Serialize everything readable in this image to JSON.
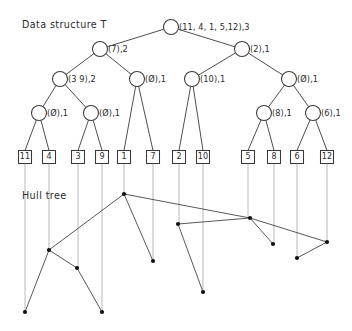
{
  "figure": {
    "width": 352,
    "height": 331,
    "background": "#ffffff",
    "stroke_color": "#3a3a3a",
    "leaf_stem_color": "#b9b9b9",
    "hull_vertex_color": "#111111",
    "captions": {
      "data_structure": "Data structure T",
      "hull_tree": "Hull tree"
    }
  },
  "tree": {
    "nodes": [
      {
        "id": "n0",
        "level": 0,
        "cx": 171,
        "cy": 27,
        "r": 7.5,
        "label": "(11, 4, 1, 5,12),3"
      },
      {
        "id": "n1",
        "level": 1,
        "cx": 100,
        "cy": 49,
        "r": 7.5,
        "label": "(7),2"
      },
      {
        "id": "n2",
        "level": 1,
        "cx": 242,
        "cy": 49,
        "r": 7.5,
        "label": "(2),1"
      },
      {
        "id": "n3",
        "level": 2,
        "cx": 60,
        "cy": 79,
        "r": 7.5,
        "label": "(3 9),2"
      },
      {
        "id": "n4",
        "level": 2,
        "cx": 137,
        "cy": 79,
        "r": 7.5,
        "label": "(Ø),1"
      },
      {
        "id": "n5",
        "level": 2,
        "cx": 192,
        "cy": 79,
        "r": 7.5,
        "label": "(10),1"
      },
      {
        "id": "n6",
        "level": 2,
        "cx": 289,
        "cy": 79,
        "r": 7.5,
        "label": "(Ø),1"
      },
      {
        "id": "n7",
        "level": 3,
        "cx": 39,
        "cy": 113,
        "r": 7.5,
        "label": "(Ø),1"
      },
      {
        "id": "n8",
        "level": 3,
        "cx": 91,
        "cy": 113,
        "r": 7.5,
        "label": "(Ø),1"
      },
      {
        "id": "n9",
        "level": 3,
        "cx": 264,
        "cy": 113,
        "r": 7.5,
        "label": "(8),1"
      },
      {
        "id": "n10",
        "level": 3,
        "cx": 313,
        "cy": 113,
        "r": 7.5,
        "label": "(6),1"
      }
    ],
    "edges": [
      [
        "n0",
        "n1"
      ],
      [
        "n0",
        "n2"
      ],
      [
        "n1",
        "n3"
      ],
      [
        "n1",
        "n4"
      ],
      [
        "n2",
        "n5"
      ],
      [
        "n2",
        "n6"
      ],
      [
        "n3",
        "n7"
      ],
      [
        "n3",
        "n8"
      ],
      [
        "n6",
        "n9"
      ],
      [
        "n6",
        "n10"
      ]
    ],
    "leaf_edges": [
      [
        "n7",
        "L11"
      ],
      [
        "n7",
        "L4"
      ],
      [
        "n8",
        "L3"
      ],
      [
        "n8",
        "L9"
      ],
      [
        "n4",
        "L1"
      ],
      [
        "n4",
        "L7"
      ],
      [
        "n5",
        "L2"
      ],
      [
        "n5",
        "L10"
      ],
      [
        "n9",
        "L5"
      ],
      [
        "n9",
        "L8"
      ],
      [
        "n10",
        "L6"
      ],
      [
        "n10",
        "L12"
      ]
    ],
    "leaves": [
      {
        "id": "L11",
        "cx": 25,
        "cy": 157,
        "label": "11"
      },
      {
        "id": "L4",
        "cx": 49,
        "cy": 157,
        "label": "4"
      },
      {
        "id": "L3",
        "cx": 78,
        "cy": 157,
        "label": "3"
      },
      {
        "id": "L9",
        "cx": 102,
        "cy": 157,
        "label": "9"
      },
      {
        "id": "L1",
        "cx": 124,
        "cy": 157,
        "label": "1"
      },
      {
        "id": "L7",
        "cx": 153,
        "cy": 157,
        "label": "7"
      },
      {
        "id": "L2",
        "cx": 179,
        "cy": 157,
        "label": "2"
      },
      {
        "id": "L10",
        "cx": 203,
        "cy": 157,
        "label": "10"
      },
      {
        "id": "L5",
        "cx": 248,
        "cy": 157,
        "label": "5"
      },
      {
        "id": "L8",
        "cx": 274,
        "cy": 157,
        "label": "8"
      },
      {
        "id": "L6",
        "cx": 297,
        "cy": 157,
        "label": "6"
      },
      {
        "id": "L12",
        "cx": 327,
        "cy": 157,
        "label": "12"
      }
    ],
    "leaf_box": {
      "w": 13,
      "h": 13
    }
  },
  "hull_tree": {
    "stems": [
      {
        "from_leaf": "L11",
        "x": 25,
        "y1": 164,
        "y2": 312
      },
      {
        "from_leaf": "L4",
        "x": 49,
        "y1": 164,
        "y2": 250
      },
      {
        "from_leaf": "L3",
        "x": 78,
        "y1": 164,
        "y2": 268
      },
      {
        "from_leaf": "L9",
        "x": 102,
        "y1": 164,
        "y2": 312
      },
      {
        "from_leaf": "L1",
        "x": 124,
        "y1": 164,
        "y2": 194
      },
      {
        "from_leaf": "L7",
        "x": 153,
        "y1": 164,
        "y2": 261
      },
      {
        "from_leaf": "L2",
        "x": 179,
        "y1": 164,
        "y2": 224
      },
      {
        "from_leaf": "L10",
        "x": 203,
        "y1": 164,
        "y2": 292
      },
      {
        "from_leaf": "L5",
        "x": 248,
        "y1": 164,
        "y2": 218
      },
      {
        "from_leaf": "L8",
        "x": 274,
        "y1": 164,
        "y2": 244
      },
      {
        "from_leaf": "L6",
        "x": 297,
        "y1": 164,
        "y2": 258
      },
      {
        "from_leaf": "L12",
        "x": 327,
        "y1": 164,
        "y2": 242
      }
    ],
    "vertices": [
      {
        "id": "v1",
        "x": 124,
        "y": 194
      },
      {
        "id": "v4",
        "x": 49,
        "y": 250
      },
      {
        "id": "v3",
        "x": 77,
        "y": 268
      },
      {
        "id": "v11",
        "x": 25,
        "y": 312
      },
      {
        "id": "v9",
        "x": 102,
        "y": 312
      },
      {
        "id": "v7",
        "x": 153,
        "y": 261
      },
      {
        "id": "v2",
        "x": 178,
        "y": 224
      },
      {
        "id": "v10",
        "x": 203,
        "y": 292
      },
      {
        "id": "v5",
        "x": 250,
        "y": 218
      },
      {
        "id": "v8",
        "x": 273,
        "y": 244
      },
      {
        "id": "v6",
        "x": 297,
        "y": 258
      },
      {
        "id": "v12",
        "x": 327,
        "y": 242
      }
    ],
    "edges": [
      [
        "v1",
        "v4"
      ],
      [
        "v1",
        "v7"
      ],
      [
        "v1",
        "v5"
      ],
      [
        "v4",
        "v3"
      ],
      [
        "v4",
        "v11"
      ],
      [
        "v3",
        "v9"
      ],
      [
        "v2",
        "v5"
      ],
      [
        "v2",
        "v10"
      ],
      [
        "v5",
        "v8"
      ],
      [
        "v5",
        "v12"
      ],
      [
        "v12",
        "v6"
      ]
    ],
    "vertex_radius": 2.1
  }
}
